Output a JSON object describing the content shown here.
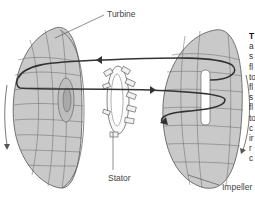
{
  "diagram": {
    "labels": {
      "turbine": "Turbine",
      "stator": "Stator",
      "impeller": "Impeller"
    },
    "colors": {
      "fill": "#c8c8c8",
      "stroke": "#555555",
      "flow_arrow": "#333333",
      "text": "#444444"
    }
  },
  "side_text": {
    "lines": [
      "T",
      "a",
      "s",
      "fl",
      "to",
      "fl",
      "s",
      "fl",
      "to",
      "c",
      "ir",
      "r",
      "c"
    ]
  }
}
